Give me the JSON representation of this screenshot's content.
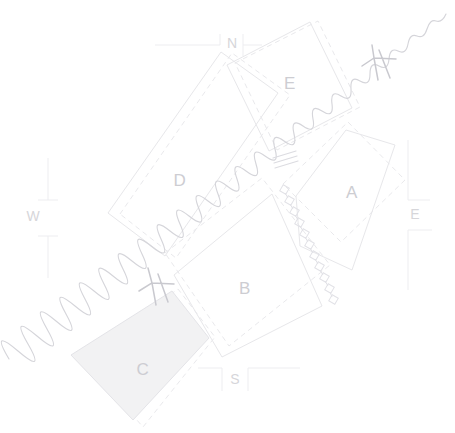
{
  "diagram": {
    "background_color": "#ffffff",
    "stroke_color": "#e7e7ea",
    "label_color": "#cdcdd2",
    "shaded_fill": "#f2f2f3"
  },
  "parcels": [
    {
      "id": "A",
      "label": "A",
      "label_x": 352,
      "label_y": 194,
      "shaded": false
    },
    {
      "id": "B",
      "label": "B",
      "label_x": 245,
      "label_y": 290,
      "shaded": false
    },
    {
      "id": "C",
      "label": "C",
      "label_x": 143,
      "label_y": 371,
      "shaded": true
    },
    {
      "id": "D",
      "label": "D",
      "label_x": 180,
      "label_y": 182,
      "shaded": false
    },
    {
      "id": "E",
      "label": "E",
      "label_x": 290,
      "label_y": 85,
      "shaded": false
    }
  ],
  "dimensions": [
    {
      "id": "north",
      "label": "N",
      "label_x": 232,
      "label_y": 44,
      "orientation": "horizontal",
      "side": "top"
    },
    {
      "id": "south",
      "label": "S",
      "label_x": 235,
      "label_y": 380,
      "orientation": "horizontal",
      "side": "bottom"
    },
    {
      "id": "east",
      "label": "E",
      "label_x": 415,
      "label_y": 215,
      "orientation": "vertical",
      "side": "right"
    },
    {
      "id": "west",
      "label": "W",
      "label_x": 33,
      "label_y": 217,
      "orientation": "vertical",
      "side": "left"
    }
  ],
  "features": [
    {
      "id": "watercourse",
      "name": "wavy-watercourse-line",
      "style": "wavy",
      "color": "#d5d5da"
    },
    {
      "id": "break-mark-ne",
      "name": "break-mark",
      "x": 383,
      "y": 62
    },
    {
      "id": "break-mark-mid",
      "name": "break-mark",
      "x": 286,
      "y": 160
    },
    {
      "id": "break-mark-sw",
      "name": "break-mark",
      "x": 158,
      "y": 285
    },
    {
      "id": "chain-line",
      "name": "chain-of-squares-line",
      "color": "#e2e2e7"
    }
  ],
  "legend": {
    "note": ""
  }
}
